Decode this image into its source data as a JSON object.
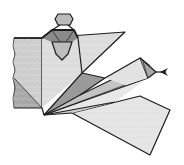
{
  "diagram": {
    "style": "black line drawing with grey textured paper shading",
    "colors": {
      "outline": "#1c1c1c",
      "panel_light": "#e6e6e6",
      "panel_mid": "#c9c9c9",
      "panel_dark": "#9a9a9a",
      "panel_darkest": "#7a7a7a",
      "background": "#ffffff"
    },
    "parts": [
      {
        "name": "left-square-panel",
        "shade": "panel_mid"
      },
      {
        "name": "head-octagon",
        "shade": "panel_mid"
      },
      {
        "name": "top-right-flap",
        "shade": "panel_light"
      },
      {
        "name": "center-fan",
        "shade": "panel_dark"
      },
      {
        "name": "right-wing",
        "shade": "panel_light"
      },
      {
        "name": "wing-tip",
        "shade": "panel_dark"
      },
      {
        "name": "bottom-large-flap",
        "shade": "panel_light"
      }
    ]
  }
}
